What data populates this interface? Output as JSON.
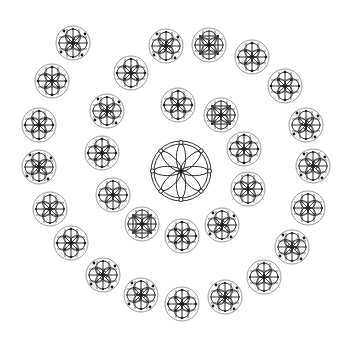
{
  "diagram": {
    "title": "",
    "background": "#ffffff",
    "stroke_color": "#1a1a1a",
    "halo_color": "#8c8c8c",
    "center_rosette": {
      "cx": 181,
      "cy": 171,
      "r_outer": 30,
      "r_inner": 27,
      "petals": 8,
      "ring_dots": 8
    },
    "emblem_radius": 17,
    "rings": [
      {
        "name": "inner-ring",
        "emblems": [
          {
            "cx": 178,
            "cy": 105,
            "variant": "quatrefoil"
          },
          {
            "cx": 221,
            "cy": 115,
            "variant": "square"
          }
        ]
      },
      {
        "name": "middle-ring",
        "emblems": [
          {
            "cx": 131,
            "cy": 73,
            "variant": "quatrefoil"
          },
          {
            "cx": 107,
            "cy": 111,
            "variant": "dotted"
          },
          {
            "cx": 102,
            "cy": 153,
            "variant": "quatrefoil"
          },
          {
            "cx": 113,
            "cy": 195,
            "variant": "plain"
          },
          {
            "cx": 142,
            "cy": 224,
            "variant": "square"
          },
          {
            "cx": 182,
            "cy": 236,
            "variant": "quatrefoil"
          },
          {
            "cx": 222,
            "cy": 225,
            "variant": "dotted"
          },
          {
            "cx": 248,
            "cy": 189,
            "variant": "plain"
          },
          {
            "cx": 244,
            "cy": 149,
            "variant": "quatrefoil"
          }
        ]
      },
      {
        "name": "outer-ring",
        "emblems": [
          {
            "cx": 73,
            "cy": 43,
            "variant": "dotted"
          },
          {
            "cx": 52,
            "cy": 81,
            "variant": "quatrefoil"
          },
          {
            "cx": 39,
            "cy": 125,
            "variant": "quatrefoil"
          },
          {
            "cx": 39,
            "cy": 167,
            "variant": "dotted"
          },
          {
            "cx": 50,
            "cy": 209,
            "variant": "plain"
          },
          {
            "cx": 71,
            "cy": 243,
            "variant": "quatrefoil"
          },
          {
            "cx": 103,
            "cy": 275,
            "variant": "dotted"
          },
          {
            "cx": 141,
            "cy": 295,
            "variant": "dotted"
          },
          {
            "cx": 182,
            "cy": 304,
            "variant": "quatrefoil"
          },
          {
            "cx": 225,
            "cy": 297,
            "variant": "dotted"
          },
          {
            "cx": 264,
            "cy": 277,
            "variant": "plain"
          },
          {
            "cx": 292,
            "cy": 247,
            "variant": "dotted"
          },
          {
            "cx": 308,
            "cy": 208,
            "variant": "plain"
          },
          {
            "cx": 313,
            "cy": 166,
            "variant": "dotted"
          },
          {
            "cx": 306,
            "cy": 125,
            "variant": "dotted"
          },
          {
            "cx": 285,
            "cy": 86,
            "variant": "quatrefoil"
          },
          {
            "cx": 252,
            "cy": 57,
            "variant": "quatrefoil"
          },
          {
            "cx": 209,
            "cy": 45,
            "variant": "square"
          },
          {
            "cx": 166,
            "cy": 46,
            "variant": "dotted"
          }
        ]
      }
    ]
  }
}
